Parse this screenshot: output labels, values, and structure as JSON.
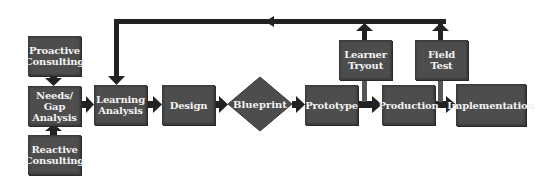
{
  "diagram": {
    "nodes": [
      {
        "id": "proactive",
        "label": "Proactive\nConsulting",
        "shape": "rect"
      },
      {
        "id": "needs",
        "label": "Needs/\nGap\nAnalysis",
        "shape": "rect"
      },
      {
        "id": "reactive",
        "label": "Reactive\nConsulting",
        "shape": "rect"
      },
      {
        "id": "learning",
        "label": "Learning\nAnalysis",
        "shape": "rect"
      },
      {
        "id": "design",
        "label": "Design",
        "shape": "rect"
      },
      {
        "id": "blueprint",
        "label": "Blueprint",
        "shape": "diamond"
      },
      {
        "id": "prototype",
        "label": "Prototype",
        "shape": "rect"
      },
      {
        "id": "tryout",
        "label": "Learner\nTryout",
        "shape": "rect"
      },
      {
        "id": "production",
        "label": "Production",
        "shape": "rect"
      },
      {
        "id": "fieldtest",
        "label": "Field\nTest",
        "shape": "rect"
      },
      {
        "id": "implementation",
        "label": "Implementation",
        "shape": "rect"
      }
    ],
    "edges": [
      [
        "proactive",
        "needs"
      ],
      [
        "reactive",
        "needs"
      ],
      [
        "needs",
        "learning"
      ],
      [
        "learning",
        "design"
      ],
      [
        "design",
        "blueprint"
      ],
      [
        "blueprint",
        "prototype"
      ],
      [
        "prototype",
        "production"
      ],
      [
        "prototype",
        "tryout"
      ],
      [
        "production",
        "implementation"
      ],
      [
        "production",
        "fieldtest"
      ],
      [
        "tryout",
        "learning"
      ],
      [
        "fieldtest",
        "learning"
      ]
    ],
    "colors": {
      "box": "#4d4d4d",
      "line": "#222222",
      "text": "#f2f2f2",
      "background": "#ffffff"
    }
  }
}
